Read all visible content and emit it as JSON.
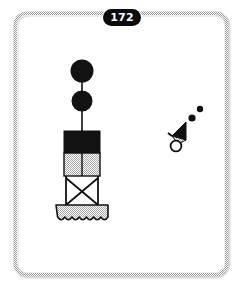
{
  "page": {
    "number": "172",
    "background_color": "#ffffff",
    "frame_color": "#b4b4b4",
    "ink_color": "#111111",
    "fill_gray": "#c9c9c9"
  },
  "figure": {
    "title": "",
    "buoy": {
      "name": "lattice-tower-buoy",
      "daymarks": [
        {
          "name": "upper-black-ball",
          "shape": "sphere",
          "color": "#111111"
        },
        {
          "name": "lower-black-ball",
          "shape": "sphere",
          "color": "#111111"
        }
      ],
      "mast": {
        "name": "mast",
        "color": "#111111"
      },
      "sections": [
        {
          "name": "upper-band",
          "fill": "black",
          "color": "#111111"
        },
        {
          "name": "lower-band",
          "fill": "gray",
          "color": "#c9c9c9",
          "divider": "vertical"
        },
        {
          "name": "lattice-frame",
          "fill": "none",
          "bracing": "cross"
        },
        {
          "name": "float-base",
          "fill": "gray",
          "color": "#c9c9c9",
          "bottom_edge": "scalloped"
        }
      ]
    },
    "pennant": {
      "name": "pennant-marker",
      "flag": {
        "name": "pennant-flag",
        "color": "#111111"
      },
      "ring": {
        "name": "mooring-ring",
        "color": "#ffffff",
        "stroke": "#111111"
      },
      "dots": [
        {
          "name": "upper-dot",
          "color": "#111111"
        },
        {
          "name": "lower-dot",
          "color": "#111111"
        }
      ]
    }
  }
}
